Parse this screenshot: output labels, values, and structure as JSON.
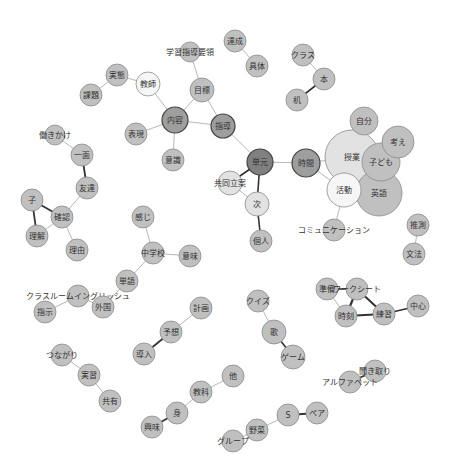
{
  "colors": {
    "default_fill": "#c0c0c0",
    "light_fill": "#e2e2e2",
    "white_fill": "#f6f6f6",
    "mid_fill": "#9e9e9e",
    "dark_fill": "#808080",
    "stroke": "#8a8a8a",
    "dark_stroke": "#444444",
    "edge_light": "#b8b8b8",
    "edge_dark": "#333333"
  },
  "nodes": [
    {
      "id": "achievement",
      "label": "達成",
      "x": 235,
      "y": 41,
      "r": 11,
      "fill": "default"
    },
    {
      "id": "concrete",
      "label": "具体",
      "x": 257,
      "y": 66,
      "r": 11,
      "fill": "default"
    },
    {
      "id": "curriculum",
      "label": "学習指導要領",
      "x": 190,
      "y": 52,
      "r": 10,
      "fill": "default"
    },
    {
      "id": "goal",
      "label": "目標",
      "x": 202,
      "y": 90,
      "r": 12,
      "fill": "default"
    },
    {
      "id": "teacher",
      "label": "教師",
      "x": 148,
      "y": 84,
      "r": 12,
      "fill": "white"
    },
    {
      "id": "practice",
      "label": "実態",
      "x": 117,
      "y": 75,
      "r": 11,
      "fill": "default"
    },
    {
      "id": "issue",
      "label": "課題",
      "x": 91,
      "y": 95,
      "r": 11,
      "fill": "default"
    },
    {
      "id": "content",
      "label": "内容",
      "x": 175,
      "y": 120,
      "r": 13,
      "fill": "mid"
    },
    {
      "id": "guidance",
      "label": "指導",
      "x": 223,
      "y": 126,
      "r": 12,
      "fill": "mid"
    },
    {
      "id": "expression",
      "label": "表現",
      "x": 136,
      "y": 134,
      "r": 11,
      "fill": "default"
    },
    {
      "id": "awareness",
      "label": "意識",
      "x": 173,
      "y": 160,
      "r": 11,
      "fill": "default"
    },
    {
      "id": "unit",
      "label": "単元",
      "x": 260,
      "y": 162,
      "r": 13,
      "fill": "dark"
    },
    {
      "id": "time",
      "label": "時間",
      "x": 306,
      "y": 163,
      "r": 14,
      "fill": "mid"
    },
    {
      "id": "cooperative",
      "label": "共同立案",
      "x": 230,
      "y": 183,
      "r": 12,
      "fill": "light"
    },
    {
      "id": "next",
      "label": "次",
      "x": 257,
      "y": 204,
      "r": 12,
      "fill": "light"
    },
    {
      "id": "individual",
      "label": "個人",
      "x": 261,
      "y": 241,
      "r": 11,
      "fill": "default"
    },
    {
      "id": "class",
      "label": "クラス",
      "x": 303,
      "y": 55,
      "r": 11,
      "fill": "default"
    },
    {
      "id": "book",
      "label": "本",
      "x": 324,
      "y": 79,
      "r": 11,
      "fill": "default"
    },
    {
      "id": "desk",
      "label": "机",
      "x": 297,
      "y": 100,
      "r": 11,
      "fill": "default"
    },
    {
      "id": "self",
      "label": "自分",
      "x": 364,
      "y": 121,
      "r": 14,
      "fill": "default"
    },
    {
      "id": "class_lesson",
      "label": "授業",
      "x": 352,
      "y": 157,
      "r": 27,
      "fill": "light"
    },
    {
      "id": "think",
      "label": "考え",
      "x": 398,
      "y": 142,
      "r": 16,
      "fill": "default"
    },
    {
      "id": "children",
      "label": "子ども",
      "x": 381,
      "y": 162,
      "r": 19,
      "fill": "default"
    },
    {
      "id": "activity",
      "label": "活動",
      "x": 344,
      "y": 190,
      "r": 17,
      "fill": "white"
    },
    {
      "id": "english",
      "label": "英語",
      "x": 379,
      "y": 193,
      "r": 23,
      "fill": "default"
    },
    {
      "id": "communication",
      "label": "コミュニケーション",
      "x": 334,
      "y": 230,
      "r": 11,
      "fill": "default"
    },
    {
      "id": "guess",
      "label": "推測",
      "x": 418,
      "y": 225,
      "r": 11,
      "fill": "default"
    },
    {
      "id": "grammar",
      "label": "文法",
      "x": 414,
      "y": 254,
      "r": 11,
      "fill": "default"
    },
    {
      "id": "encourage",
      "label": "働きかけ",
      "x": 55,
      "y": 135,
      "r": 10,
      "fill": "default"
    },
    {
      "id": "aspect",
      "label": "一面",
      "x": 82,
      "y": 155,
      "r": 11,
      "fill": "default"
    },
    {
      "id": "friend",
      "label": "友達",
      "x": 87,
      "y": 188,
      "r": 11,
      "fill": "default"
    },
    {
      "id": "child",
      "label": "子",
      "x": 32,
      "y": 200,
      "r": 11,
      "fill": "default"
    },
    {
      "id": "confirm",
      "label": "確認",
      "x": 62,
      "y": 217,
      "r": 11,
      "fill": "default"
    },
    {
      "id": "understand",
      "label": "理解",
      "x": 37,
      "y": 236,
      "r": 11,
      "fill": "default"
    },
    {
      "id": "reason",
      "label": "理由",
      "x": 77,
      "y": 250,
      "r": 11,
      "fill": "default"
    },
    {
      "id": "feeling",
      "label": "感じ",
      "x": 143,
      "y": 217,
      "r": 11,
      "fill": "default"
    },
    {
      "id": "juniorhigh",
      "label": "中学校",
      "x": 153,
      "y": 253,
      "r": 11,
      "fill": "default"
    },
    {
      "id": "meaning",
      "label": "意味",
      "x": 190,
      "y": 256,
      "r": 11,
      "fill": "default"
    },
    {
      "id": "word",
      "label": "単語",
      "x": 127,
      "y": 281,
      "r": 11,
      "fill": "default"
    },
    {
      "id": "classroom_english",
      "label": "クラスルームイングリッシュ",
      "x": 78,
      "y": 296,
      "r": 11,
      "fill": "default"
    },
    {
      "id": "foreign",
      "label": "外国",
      "x": 103,
      "y": 307,
      "r": 11,
      "fill": "default"
    },
    {
      "id": "instruction",
      "label": "指示",
      "x": 45,
      "y": 312,
      "r": 11,
      "fill": "default"
    },
    {
      "id": "plan",
      "label": "計画",
      "x": 201,
      "y": 308,
      "r": 11,
      "fill": "default"
    },
    {
      "id": "prediction",
      "label": "予想",
      "x": 171,
      "y": 332,
      "r": 11,
      "fill": "default"
    },
    {
      "id": "introduction",
      "label": "導入",
      "x": 144,
      "y": 354,
      "r": 11,
      "fill": "default"
    },
    {
      "id": "quiz",
      "label": "クイズ",
      "x": 258,
      "y": 301,
      "r": 11,
      "fill": "default"
    },
    {
      "id": "song",
      "label": "歌",
      "x": 274,
      "y": 332,
      "r": 12,
      "fill": "default"
    },
    {
      "id": "game",
      "label": "ゲーム",
      "x": 293,
      "y": 357,
      "r": 12,
      "fill": "default"
    },
    {
      "id": "preparation",
      "label": "準備",
      "x": 327,
      "y": 289,
      "r": 11,
      "fill": "default"
    },
    {
      "id": "worksheet",
      "label": "ワークシート",
      "x": 357,
      "y": 289,
      "r": 11,
      "fill": "default"
    },
    {
      "id": "moment",
      "label": "時刻",
      "x": 346,
      "y": 316,
      "r": 11,
      "fill": "default"
    },
    {
      "id": "exercise",
      "label": "練習",
      "x": 384,
      "y": 314,
      "r": 11,
      "fill": "default"
    },
    {
      "id": "center",
      "label": "中心",
      "x": 418,
      "y": 306,
      "r": 11,
      "fill": "default"
    },
    {
      "id": "listening",
      "label": "聞き取り",
      "x": 375,
      "y": 371,
      "r": 11,
      "fill": "default"
    },
    {
      "id": "alphabet",
      "label": "アルファベット",
      "x": 350,
      "y": 382,
      "r": 11,
      "fill": "default"
    },
    {
      "id": "connection",
      "label": "つながり",
      "x": 62,
      "y": 355,
      "r": 11,
      "fill": "default"
    },
    {
      "id": "realization",
      "label": "実習",
      "x": 89,
      "y": 375,
      "r": 11,
      "fill": "default"
    },
    {
      "id": "share",
      "label": "共有",
      "x": 110,
      "y": 401,
      "r": 11,
      "fill": "default"
    },
    {
      "id": "other",
      "label": "他",
      "x": 233,
      "y": 376,
      "r": 11,
      "fill": "default"
    },
    {
      "id": "subject",
      "label": "教科",
      "x": 201,
      "y": 392,
      "r": 11,
      "fill": "default"
    },
    {
      "id": "body",
      "label": "身",
      "x": 177,
      "y": 413,
      "r": 11,
      "fill": "default"
    },
    {
      "id": "interest",
      "label": "興味",
      "x": 152,
      "y": 427,
      "r": 11,
      "fill": "default"
    },
    {
      "id": "s",
      "label": "S",
      "x": 288,
      "y": 415,
      "r": 11,
      "fill": "default"
    },
    {
      "id": "pair",
      "label": "ペア",
      "x": 317,
      "y": 413,
      "r": 11,
      "fill": "default"
    },
    {
      "id": "vegetable",
      "label": "野菜",
      "x": 257,
      "y": 430,
      "r": 11,
      "fill": "default"
    },
    {
      "id": "group",
      "label": "グループ",
      "x": 233,
      "y": 441,
      "r": 11,
      "fill": "default"
    }
  ],
  "edges": [
    {
      "a": "achievement",
      "b": "concrete",
      "w": 1,
      "dark": false
    },
    {
      "a": "curriculum",
      "b": "goal",
      "w": 1,
      "dark": false
    },
    {
      "a": "goal",
      "b": "content",
      "w": 1,
      "dark": false
    },
    {
      "a": "goal",
      "b": "guidance",
      "w": 1,
      "dark": false
    },
    {
      "a": "teacher",
      "b": "content",
      "w": 1,
      "dark": false
    },
    {
      "a": "teacher",
      "b": "practice",
      "w": 1,
      "dark": false
    },
    {
      "a": "practice",
      "b": "issue",
      "w": 1,
      "dark": false
    },
    {
      "a": "content",
      "b": "guidance",
      "w": 1,
      "dark": false
    },
    {
      "a": "content",
      "b": "expression",
      "w": 1,
      "dark": false
    },
    {
      "a": "content",
      "b": "awareness",
      "w": 1,
      "dark": false
    },
    {
      "a": "guidance",
      "b": "unit",
      "w": 1,
      "dark": false
    },
    {
      "a": "unit",
      "b": "time",
      "w": 1,
      "dark": false
    },
    {
      "a": "unit",
      "b": "cooperative",
      "w": 1.6,
      "dark": true
    },
    {
      "a": "unit",
      "b": "next",
      "w": 1.6,
      "dark": true
    },
    {
      "a": "cooperative",
      "b": "next",
      "w": 1,
      "dark": false
    },
    {
      "a": "next",
      "b": "individual",
      "w": 1.6,
      "dark": true
    },
    {
      "a": "class",
      "b": "book",
      "w": 1,
      "dark": false
    },
    {
      "a": "book",
      "b": "desk",
      "w": 1.6,
      "dark": true
    },
    {
      "a": "time",
      "b": "class_lesson",
      "w": 1,
      "dark": false
    },
    {
      "a": "time",
      "b": "activity",
      "w": 1,
      "dark": false
    },
    {
      "a": "activity",
      "b": "communication",
      "w": 1,
      "dark": false
    },
    {
      "a": "guess",
      "b": "grammar",
      "w": 1,
      "dark": false
    },
    {
      "a": "encourage",
      "b": "aspect",
      "w": 1,
      "dark": false
    },
    {
      "a": "aspect",
      "b": "friend",
      "w": 1.8,
      "dark": true
    },
    {
      "a": "friend",
      "b": "confirm",
      "w": 1,
      "dark": false
    },
    {
      "a": "child",
      "b": "confirm",
      "w": 1.8,
      "dark": true
    },
    {
      "a": "child",
      "b": "understand",
      "w": 1.8,
      "dark": true
    },
    {
      "a": "confirm",
      "b": "understand",
      "w": 1,
      "dark": false
    },
    {
      "a": "confirm",
      "b": "reason",
      "w": 1,
      "dark": false
    },
    {
      "a": "feeling",
      "b": "juniorhigh",
      "w": 1,
      "dark": false
    },
    {
      "a": "juniorhigh",
      "b": "meaning",
      "w": 1,
      "dark": false
    },
    {
      "a": "juniorhigh",
      "b": "word",
      "w": 1,
      "dark": false
    },
    {
      "a": "word",
      "b": "foreign",
      "w": 1,
      "dark": false
    },
    {
      "a": "classroom_english",
      "b": "foreign",
      "w": 1,
      "dark": false
    },
    {
      "a": "classroom_english",
      "b": "instruction",
      "w": 1,
      "dark": false
    },
    {
      "a": "plan",
      "b": "prediction",
      "w": 1,
      "dark": false
    },
    {
      "a": "prediction",
      "b": "introduction",
      "w": 1.8,
      "dark": true
    },
    {
      "a": "quiz",
      "b": "song",
      "w": 1,
      "dark": false
    },
    {
      "a": "song",
      "b": "game",
      "w": 1.6,
      "dark": true
    },
    {
      "a": "preparation",
      "b": "worksheet",
      "w": 1.6,
      "dark": true
    },
    {
      "a": "preparation",
      "b": "moment",
      "w": 1,
      "dark": false
    },
    {
      "a": "worksheet",
      "b": "moment",
      "w": 2.2,
      "dark": true
    },
    {
      "a": "worksheet",
      "b": "exercise",
      "w": 2,
      "dark": true
    },
    {
      "a": "moment",
      "b": "exercise",
      "w": 2,
      "dark": true
    },
    {
      "a": "exercise",
      "b": "center",
      "w": 1.6,
      "dark": true
    },
    {
      "a": "listening",
      "b": "alphabet",
      "w": 1.8,
      "dark": true
    },
    {
      "a": "connection",
      "b": "realization",
      "w": 1,
      "dark": false
    },
    {
      "a": "realization",
      "b": "share",
      "w": 1,
      "dark": false
    },
    {
      "a": "other",
      "b": "subject",
      "w": 1,
      "dark": false
    },
    {
      "a": "subject",
      "b": "body",
      "w": 1,
      "dark": false
    },
    {
      "a": "body",
      "b": "interest",
      "w": 1.8,
      "dark": true
    },
    {
      "a": "s",
      "b": "pair",
      "w": 1.8,
      "dark": true
    },
    {
      "a": "s",
      "b": "vegetable",
      "w": 1,
      "dark": false
    },
    {
      "a": "vegetable",
      "b": "group",
      "w": 1,
      "dark": false
    }
  ]
}
